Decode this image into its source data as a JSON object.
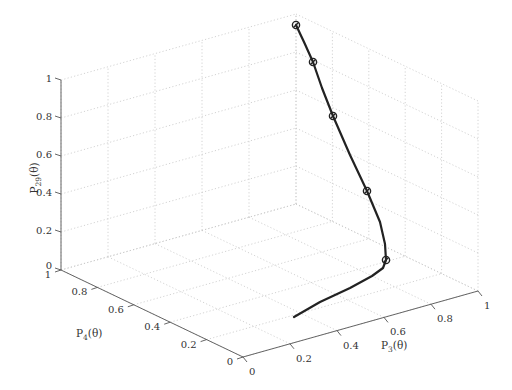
{
  "chart_data": {
    "type": "line3d",
    "title": "",
    "xlabel": "P3(θ)",
    "ylabel": "P4(θ)",
    "zlabel": "P29(θ)",
    "axes": {
      "x": {
        "label_main": "P",
        "label_sub": "3",
        "label_tail": "(θ)",
        "ticks": [
          "0",
          "0.2",
          "0.4",
          "0.6",
          "0.8",
          "1"
        ],
        "range": [
          0,
          1
        ]
      },
      "y": {
        "label_main": "P",
        "label_sub": "4",
        "label_tail": "(θ)",
        "ticks": [
          "0",
          "0.2",
          "0.4",
          "0.6",
          "0.8",
          "1"
        ],
        "range": [
          0,
          1
        ]
      },
      "z": {
        "label_main": "P",
        "label_sub": "29",
        "label_tail": "(θ)",
        "ticks": [
          "0",
          "0.2",
          "0.4",
          "0.6",
          "0.8",
          "1"
        ],
        "range": [
          0,
          1
        ]
      }
    },
    "grid": true,
    "series": [
      {
        "name": "trajectory",
        "style": "solid black line with circle markers",
        "points_screen": [
          [
            294,
            317
          ],
          [
            320,
            302
          ],
          [
            350,
            288
          ],
          [
            372,
            276
          ],
          [
            383,
            268
          ],
          [
            386,
            260
          ],
          [
            385,
            244
          ],
          [
            380,
            222
          ],
          [
            367,
            191
          ],
          [
            350,
            155
          ],
          [
            333,
            116
          ],
          [
            322,
            88
          ],
          [
            313,
            62
          ],
          [
            304,
            42
          ],
          [
            296,
            25
          ]
        ],
        "markers_screen": [
          [
            296,
            25
          ],
          [
            313,
            62
          ],
          [
            333,
            116
          ],
          [
            367,
            191
          ],
          [
            386,
            260
          ]
        ]
      }
    ]
  }
}
